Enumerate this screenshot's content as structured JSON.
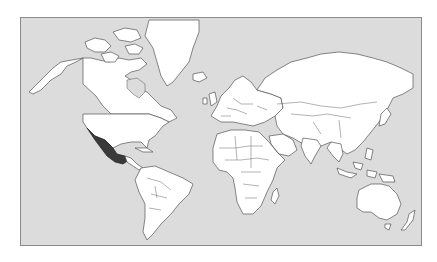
{
  "map": {
    "projection": "mercator",
    "highlighted_country": "Mexico",
    "colors": {
      "ocean": "#dcdcdc",
      "land": "#ffffff",
      "highlight": "#3a3a3a",
      "border": "#555555",
      "frame": "#8a8a8a"
    }
  }
}
